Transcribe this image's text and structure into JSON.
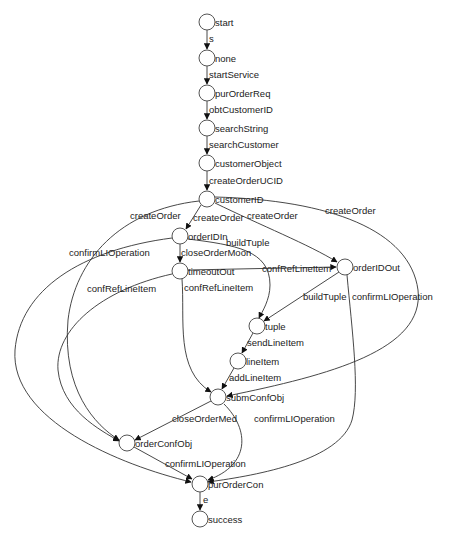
{
  "diagram": {
    "type": "state-transition-graph",
    "colors": {
      "background": "#ffffff",
      "stroke": "#333333",
      "node_fill": "#ffffff",
      "text": "#222222"
    },
    "nodes": [
      {
        "id": "start",
        "label": "start",
        "x": 207,
        "y": 22
      },
      {
        "id": "none",
        "label": "none",
        "x": 207,
        "y": 58
      },
      {
        "id": "purOrderReq",
        "label": "purOrderReq",
        "x": 207,
        "y": 93
      },
      {
        "id": "searchString",
        "label": "searchString",
        "x": 207,
        "y": 128
      },
      {
        "id": "customerObject",
        "label": "customerObject",
        "x": 207,
        "y": 163
      },
      {
        "id": "customerID",
        "label": "customerID",
        "x": 207,
        "y": 199
      },
      {
        "id": "orderIDIn",
        "label": "orderIDIn",
        "x": 180,
        "y": 236
      },
      {
        "id": "timeoutOut",
        "label": "timeoutOut",
        "x": 180,
        "y": 271
      },
      {
        "id": "orderIDOut",
        "label": "orderIDOut",
        "x": 345,
        "y": 267
      },
      {
        "id": "tuple",
        "label": "tuple",
        "x": 257,
        "y": 326
      },
      {
        "id": "lineItem",
        "label": "lineItem",
        "x": 238,
        "y": 361
      },
      {
        "id": "submConfObj",
        "label": "submConfObj",
        "x": 218,
        "y": 397
      },
      {
        "id": "orderConfObj",
        "label": "orderConfObj",
        "x": 127,
        "y": 443
      },
      {
        "id": "purOrderCon",
        "label": "purOrderCon",
        "x": 200,
        "y": 484
      },
      {
        "id": "success",
        "label": "success",
        "x": 200,
        "y": 519
      }
    ],
    "edges": [
      {
        "from": "start",
        "to": "none",
        "label": "s",
        "d": "M207,30 L207,49",
        "lx": 209,
        "ly": 42
      },
      {
        "from": "none",
        "to": "purOrderReq",
        "label": "startService",
        "d": "M207,66 L207,84",
        "lx": 209,
        "ly": 78
      },
      {
        "from": "purOrderReq",
        "to": "searchString",
        "label": "obtCustomerID",
        "d": "M207,101 L207,119",
        "lx": 209,
        "ly": 113
      },
      {
        "from": "searchString",
        "to": "customerObject",
        "label": "searchCustomer",
        "d": "M207,136 L207,154",
        "lx": 209,
        "ly": 148
      },
      {
        "from": "customerObject",
        "to": "customerID",
        "label": "createOrderUCID",
        "d": "M207,171 L207,190",
        "lx": 209,
        "ly": 184
      },
      {
        "from": "customerID",
        "to": "orderIDIn",
        "label": "createOrder",
        "d": "M201,205 L186,229",
        "lx": 193,
        "ly": 221
      },
      {
        "from": "customerID",
        "to": "orderIDOut",
        "label": "createOrder",
        "d": "M215,203 C260,225 310,245 337,262",
        "lx": 247,
        "ly": 219
      },
      {
        "from": "customerID",
        "to": "orderConfObj",
        "label": "createOrder",
        "d": "M199,201 C120,210 75,260 68,320 C62,390 95,425 119,440",
        "lx": 130,
        "ly": 219
      },
      {
        "from": "customerID",
        "to": "submConfObj",
        "label": "createOrder",
        "d": "M215,197 C330,200 410,230 418,290 C425,350 330,375 227,396",
        "lx": 325,
        "ly": 214
      },
      {
        "from": "orderIDIn",
        "to": "timeoutOut",
        "label": "closeOrderMoon",
        "d": "M180,244 L180,262",
        "lx": 181,
        "ly": 256
      },
      {
        "from": "orderIDIn",
        "to": "tuple",
        "label": "buildTuple",
        "d": "M188,239 C235,245 270,250 270,285 C270,300 262,312 259,318",
        "lx": 226,
        "ly": 246
      },
      {
        "from": "orderIDIn",
        "to": "purOrderCon",
        "label": "confirmLIOperation",
        "d": "M172,238 C80,250 20,290 15,350 C10,420 120,465 191,482",
        "lx": 69,
        "ly": 256
      },
      {
        "from": "timeoutOut",
        "to": "orderIDOut",
        "label": "confRefLineItem",
        "d": "M188,270 L336,267",
        "lx": 262,
        "ly": 272
      },
      {
        "from": "timeoutOut",
        "to": "submConfObj",
        "label": "confRefLineItem",
        "d": "M182,279 C185,320 175,370 211,392",
        "lx": 184,
        "ly": 291
      },
      {
        "from": "timeoutOut",
        "to": "orderConfObj",
        "label": "confRefLineItem",
        "d": "M172,274 C100,290 55,330 58,370 C62,410 100,430 119,441",
        "lx": 87,
        "ly": 292
      },
      {
        "from": "orderIDOut",
        "to": "tuple",
        "label": "buildTuple",
        "d": "M339,272 L264,321",
        "lx": 303,
        "ly": 300
      },
      {
        "from": "orderIDOut",
        "to": "purOrderCon",
        "label": "confirmLIOperation",
        "d": "M347,275 C352,330 360,390 352,420 C340,460 260,475 208,482",
        "lx": 352,
        "ly": 300
      },
      {
        "from": "tuple",
        "to": "lineItem",
        "label": "sendLineItem",
        "d": "M253,333 L242,353",
        "lx": 247,
        "ly": 346
      },
      {
        "from": "lineItem",
        "to": "submConfObj",
        "label": "addLineItem",
        "d": "M234,368 L222,389",
        "lx": 229,
        "ly": 381
      },
      {
        "from": "submConfObj",
        "to": "orderConfObj",
        "label": "closeOrderMed",
        "d": "M211,401 L135,440",
        "lx": 172,
        "ly": 422
      },
      {
        "from": "submConfObj",
        "to": "purOrderCon",
        "label": "confirmLIOperation",
        "d": "M224,404 C250,430 250,465 208,480",
        "lx": 254,
        "ly": 422
      },
      {
        "from": "orderConfObj",
        "to": "purOrderCon",
        "label": "confirmLIOperation",
        "d": "M134,447 L192,479",
        "lx": 165,
        "ly": 467
      },
      {
        "from": "purOrderCon",
        "to": "success",
        "label": "e",
        "d": "M200,492 L200,510",
        "lx": 203,
        "ly": 503
      }
    ]
  }
}
